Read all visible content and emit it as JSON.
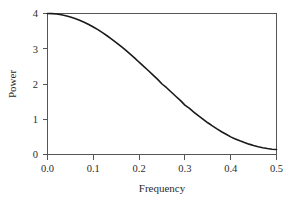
{
  "figure": {
    "background_color": "#ffffff",
    "frame_color": "#555555",
    "curve_color": "#1a1a1a"
  },
  "axes": {
    "x_title": "Frequency",
    "y_title": "Power",
    "x_ticks": [
      "0.0",
      "0.1",
      "0.2",
      "0.3",
      "0.4",
      "0.5"
    ],
    "y_ticks": [
      "0",
      "1",
      "2",
      "3",
      "4"
    ]
  },
  "chart_data": {
    "type": "line",
    "title": "",
    "subtitle": "",
    "xlabel": "Frequency",
    "ylabel": "Power",
    "xlim": [
      0.0,
      0.5
    ],
    "ylim": [
      0.0,
      4.0
    ],
    "xticks": [
      0.0,
      0.1,
      0.2,
      0.3,
      0.4,
      0.5
    ],
    "xticklabels": [
      "0.0",
      "0.1",
      "0.2",
      "0.3",
      "0.4",
      "0.5"
    ],
    "yticks": [
      0,
      1,
      2,
      3,
      4
    ],
    "yticklabels": [
      "0",
      "1",
      "2",
      "3",
      "4"
    ],
    "grid": false,
    "legend": false,
    "legend_position": "none",
    "annotations": [],
    "series": [
      {
        "name": "Spectral density",
        "color": "#1a1a1a",
        "linewidth": 1.6,
        "x": [
          0.0,
          0.01,
          0.02,
          0.03,
          0.04,
          0.05,
          0.06,
          0.07,
          0.08,
          0.09,
          0.1,
          0.11,
          0.12,
          0.13,
          0.14,
          0.15,
          0.16,
          0.17,
          0.18,
          0.19,
          0.2,
          0.21,
          0.22,
          0.23,
          0.24,
          0.25,
          0.26,
          0.27,
          0.28,
          0.29,
          0.3,
          0.31,
          0.32,
          0.33,
          0.34,
          0.35,
          0.36,
          0.37,
          0.38,
          0.39,
          0.4,
          0.41,
          0.42,
          0.43,
          0.44,
          0.45,
          0.46,
          0.47,
          0.48,
          0.49,
          0.5
        ],
        "y": [
          4.0,
          3.996,
          3.984,
          3.965,
          3.938,
          3.902,
          3.86,
          3.81,
          3.753,
          3.69,
          3.618,
          3.541,
          3.458,
          3.369,
          3.275,
          3.176,
          3.072,
          2.965,
          2.854,
          2.74,
          2.618,
          2.502,
          2.382,
          2.261,
          2.139,
          2.0,
          1.894,
          1.772,
          1.652,
          1.534,
          1.4,
          1.306,
          1.198,
          1.094,
          0.995,
          0.9,
          0.81,
          0.725,
          0.646,
          0.573,
          0.5,
          0.442,
          0.387,
          0.338,
          0.294,
          0.255,
          0.221,
          0.192,
          0.168,
          0.15,
          0.14
        ]
      }
    ]
  }
}
